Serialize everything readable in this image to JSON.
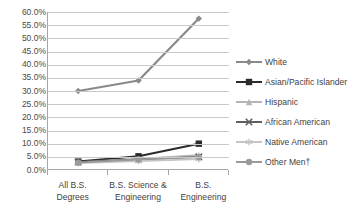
{
  "chart_data": {
    "type": "line",
    "title": "",
    "xlabel": "",
    "ylabel": "",
    "ylim": [
      0,
      60
    ],
    "ytick_step": 5,
    "grid": true,
    "legend_position": "right",
    "categories": [
      "All B.S. Degrees",
      "B.S. Science & Engineering",
      "B.S. Engineering"
    ],
    "category_lines": [
      [
        "All B.S.",
        "Degrees"
      ],
      [
        "B.S. Science &",
        "Engineering"
      ],
      [
        "B.S.",
        "Engineering"
      ]
    ],
    "ytick_labels": [
      "60.0%",
      "55.0%",
      "50.0%",
      "45.0%",
      "40.0%",
      "35.0%",
      "30.0%",
      "25.0%",
      "20.0%",
      "15.0%",
      "10.0%",
      "5.0%",
      "0.0%"
    ],
    "series": [
      {
        "name": "White",
        "marker": "diamond",
        "color": "#8a8a8a",
        "width": 2.2,
        "values": [
          30.0,
          34.0,
          57.5
        ]
      },
      {
        "name": "Asian/Pacific Islander",
        "marker": "square",
        "color": "#2b2b2b",
        "width": 2.0,
        "values": [
          3.2,
          5.2,
          10.0
        ]
      },
      {
        "name": "Hispanic",
        "marker": "triangle",
        "color": "#b5b5b5",
        "width": 1.8,
        "values": [
          3.0,
          4.2,
          5.6
        ]
      },
      {
        "name": "African American",
        "marker": "x",
        "color": "#5f5f5f",
        "width": 1.8,
        "values": [
          3.0,
          4.0,
          5.0
        ]
      },
      {
        "name": "Native American",
        "marker": "asterisk",
        "color": "#c4c4c4",
        "width": 1.8,
        "values": [
          2.6,
          3.4,
          4.1
        ]
      },
      {
        "name": "Other Men†",
        "marker": "circle",
        "color": "#9a9a9a",
        "width": 1.8,
        "values": [
          2.8,
          4.0,
          4.9
        ]
      }
    ]
  },
  "axis": {
    "line_color": "#a6a6a6",
    "grid_color": "#c9c9c9"
  }
}
